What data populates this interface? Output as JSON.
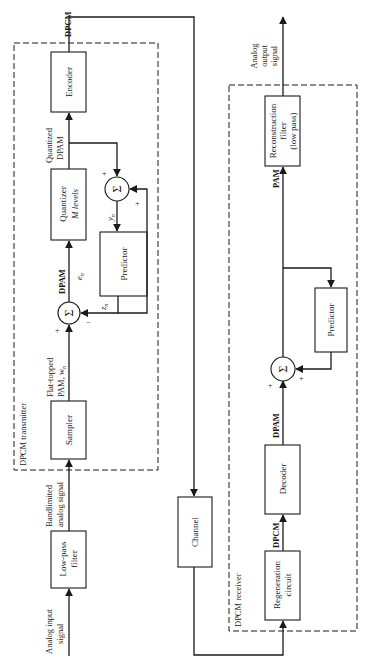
{
  "diagram": {
    "orientation": "rotated 90 degrees counter-clockwise",
    "transmitter": {
      "label": "DPCM transmitter",
      "blocks": {
        "lowpass": [
          "Low-pass",
          "filter"
        ],
        "sampler": "Sampler",
        "quantizer": [
          "Quantizer",
          "M levels"
        ],
        "encoder": "Encoder",
        "predictor": "Predictor"
      },
      "signals": {
        "input": [
          "Analog input",
          "signal"
        ],
        "bandlimited": [
          "Bandlimited",
          "analog signal"
        ],
        "flat_topped": [
          "Flat-topped",
          "PAM, w"
        ],
        "flat_topped_sub": "n",
        "dpam": "DPAM",
        "e_n": "e",
        "e_n_sub": "n",
        "quantized": [
          "Quantized",
          "DPAM"
        ],
        "y_n": "y",
        "y_n_sub": "n",
        "z_n": "z",
        "z_n_sub": "n",
        "output": "DPCM"
      },
      "summers": {
        "diff": {
          "symbol": "Σ",
          "plus": "+",
          "minus": "−"
        },
        "recon": {
          "symbol": "Σ",
          "plus_top": "+",
          "plus_side": "+"
        }
      }
    },
    "channel": {
      "label": "Channel"
    },
    "receiver": {
      "label": "DPCM receiver",
      "blocks": {
        "regeneration": [
          "Regeneration",
          "circuit"
        ],
        "decoder": "Decoder",
        "predictor": "Predictor",
        "reconstruction": [
          "Reconstruction",
          "filter",
          "(low pass)"
        ]
      },
      "signals": {
        "dpcm": "DPCM",
        "dpam": "DPAM",
        "pam": "PAM",
        "output": [
          "Analog",
          "output",
          "signal"
        ]
      },
      "summer": {
        "symbol": "Σ",
        "plus_a": "+",
        "plus_b": "+"
      }
    }
  }
}
